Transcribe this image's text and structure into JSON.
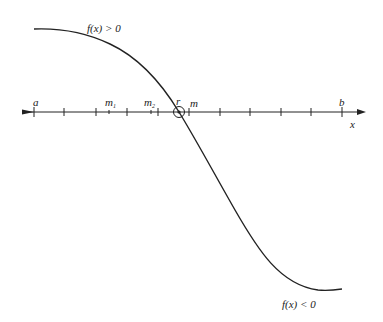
{
  "diagram": {
    "type": "bisection-method-illustration",
    "labels": {
      "upper_region": "f(x) > 0",
      "lower_region": "f(x) < 0",
      "left_endpoint": "a",
      "right_endpoint": "b",
      "root": "r",
      "midpoint": "m",
      "midpoint1": "m",
      "midpoint1_sub": "1",
      "midpoint2": "m",
      "midpoint2_sub": "2",
      "axis": "x"
    },
    "colors": {
      "line": "#222222",
      "background": "#ffffff"
    },
    "axis": {
      "y": 112,
      "x_start": 22,
      "x_end": 364
    },
    "ticks_x": [
      34,
      64,
      96,
      127,
      158,
      189,
      220,
      250,
      281,
      311,
      342
    ],
    "minor_ticks_x": [
      109,
      151
    ],
    "root_point": [
      179,
      112
    ]
  }
}
